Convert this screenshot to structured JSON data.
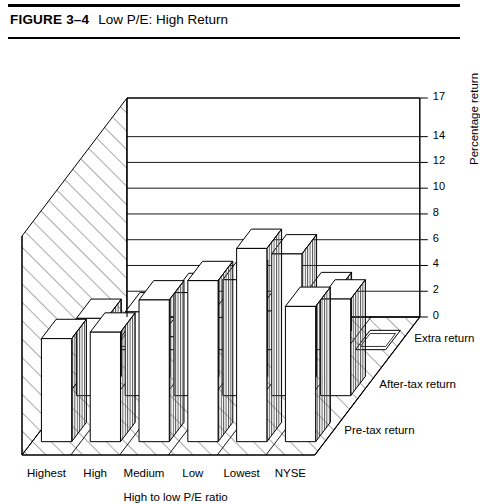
{
  "figure": {
    "number": "FIGURE 3–4",
    "title": "Low P/E: High Return"
  },
  "chart_data": {
    "type": "bar",
    "variant": "3d-grouped-bar",
    "title": "Low P/E: High Return",
    "xlabel": "High to low P/E ratio",
    "ylabel": "Percentage return",
    "zlabel": "",
    "categories": [
      "Highest",
      "High",
      "Medium",
      "Low",
      "Lowest",
      "NYSE"
    ],
    "series": [
      {
        "name": "Pre-tax return",
        "values": [
          8.0,
          8.5,
          11.0,
          12.5,
          15.0,
          10.5
        ]
      },
      {
        "name": "After-tax return",
        "values": [
          6.0,
          6.5,
          8.0,
          9.0,
          11.0,
          7.5
        ]
      },
      {
        "name": "Extra return",
        "values": [
          0.0,
          1.0,
          2.5,
          3.0,
          4.5,
          0.0
        ]
      }
    ],
    "ylim": [
      0,
      17
    ],
    "yticks": [
      0,
      2,
      4,
      6,
      8,
      10,
      12,
      14,
      17
    ],
    "ytick_labels": [
      "0",
      "2",
      "4",
      "6",
      "8",
      "10",
      "12",
      "14",
      "17"
    ],
    "grid": true,
    "legend": "depth-axis",
    "colors": {
      "bar_face": "#ffffff",
      "bar_outline": "#000000",
      "bar_side_hatch": "#555555",
      "wall_hatch": "#555555",
      "background": "#ffffff"
    }
  }
}
